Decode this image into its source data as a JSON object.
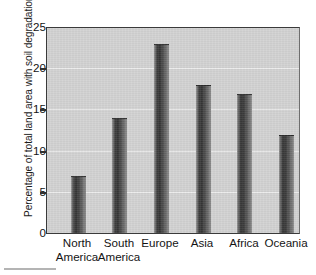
{
  "chart_data": {
    "type": "bar",
    "title": "",
    "xlabel": "",
    "ylabel": "Percentage of total land area with soil degradation",
    "categories": [
      "North America",
      "South America",
      "Europe",
      "Asia",
      "Africa",
      "Oceania"
    ],
    "category_lines": [
      [
        "North",
        "America"
      ],
      [
        "South",
        "America"
      ],
      [
        "Europe",
        ""
      ],
      [
        "Asia",
        ""
      ],
      [
        "Africa",
        ""
      ],
      [
        "Oceania",
        ""
      ]
    ],
    "values": [
      7,
      14,
      23,
      18,
      17,
      12
    ],
    "ylim": [
      0,
      25
    ],
    "yticks": [
      0,
      5,
      10,
      15,
      20,
      25
    ],
    "ytick_labels": [
      "0",
      "5",
      "10",
      "15",
      "20",
      "25"
    ],
    "grid": true,
    "grid_axis": "y",
    "legend": false,
    "colors": {
      "plot_background": "#d2d2d2",
      "page_background": "#ffffff",
      "bar_dark": "#353535",
      "bar_light": "#9c9c9c",
      "axis": "#303030",
      "gridline": "#ececec",
      "text": "#141414"
    }
  }
}
